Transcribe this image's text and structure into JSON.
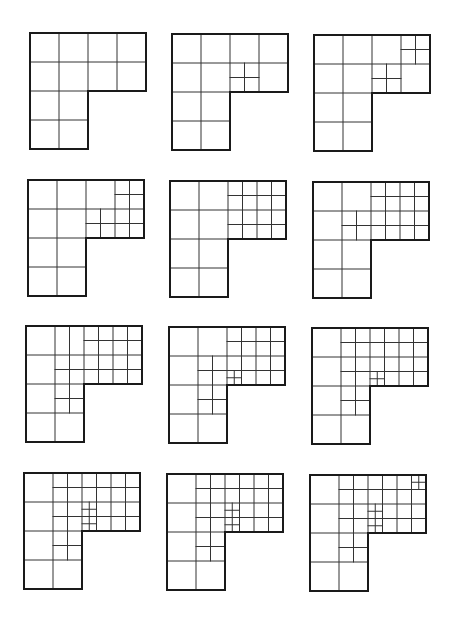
{
  "figure": {
    "unit_px": 29,
    "outline_color": "#1a1a1a",
    "line_color": "#333333",
    "panels": [
      {
        "id": 1,
        "x": 29,
        "y": 32,
        "segments": []
      },
      {
        "id": 2,
        "x": 171,
        "y": 33,
        "segments": [
          [
            2.5,
            1,
            2.5,
            2
          ],
          [
            2,
            1.5,
            3,
            1.5
          ]
        ]
      },
      {
        "id": 3,
        "x": 313,
        "y": 34,
        "segments": [
          [
            2.5,
            1,
            2.5,
            2
          ],
          [
            2,
            1.5,
            3,
            1.5
          ],
          [
            3.5,
            0,
            3.5,
            1
          ],
          [
            3,
            0.5,
            4,
            0.5
          ]
        ]
      },
      {
        "id": 4,
        "x": 27,
        "y": 179,
        "segments": [
          [
            3.5,
            0,
            3.5,
            2
          ],
          [
            3,
            0.5,
            4,
            0.5
          ],
          [
            2.5,
            1,
            2.5,
            2
          ],
          [
            2,
            1.5,
            4,
            1.5
          ]
        ]
      },
      {
        "id": 5,
        "x": 169,
        "y": 180,
        "segments": [
          [
            2.5,
            0,
            2.5,
            2
          ],
          [
            3.5,
            0,
            3.5,
            2
          ],
          [
            2,
            0.5,
            4,
            0.5
          ],
          [
            2,
            1.5,
            4,
            1.5
          ]
        ]
      },
      {
        "id": 6,
        "x": 312,
        "y": 181,
        "segments": [
          [
            2.5,
            0,
            2.5,
            2
          ],
          [
            3.5,
            0,
            3.5,
            2
          ],
          [
            2,
            0.5,
            4,
            0.5
          ],
          [
            2,
            1.5,
            4,
            1.5
          ],
          [
            1.5,
            1,
            1.5,
            2
          ],
          [
            1,
            1.5,
            2,
            1.5
          ]
        ]
      },
      {
        "id": 7,
        "x": 25,
        "y": 325,
        "segments": [
          [
            2.5,
            0,
            2.5,
            2
          ],
          [
            3.5,
            0,
            3.5,
            2
          ],
          [
            2,
            0.5,
            4,
            0.5
          ],
          [
            1,
            1.5,
            4,
            1.5
          ],
          [
            1.5,
            0,
            1.5,
            3
          ],
          [
            1,
            2.5,
            2,
            2.5
          ]
        ]
      },
      {
        "id": 8,
        "x": 168,
        "y": 326,
        "segments": [
          [
            2.5,
            0,
            2.5,
            2
          ],
          [
            3.5,
            0,
            3.5,
            2
          ],
          [
            2,
            0.5,
            4,
            0.5
          ],
          [
            1,
            1.5,
            4,
            1.5
          ],
          [
            1.5,
            1,
            1.5,
            3
          ],
          [
            1,
            2.5,
            2,
            2.5
          ],
          [
            2.25,
            1.5,
            2.25,
            2
          ],
          [
            2,
            1.75,
            2.5,
            1.75
          ]
        ]
      },
      {
        "id": 9,
        "x": 311,
        "y": 327,
        "segments": [
          [
            2.5,
            0,
            2.5,
            2
          ],
          [
            3.5,
            0,
            3.5,
            2
          ],
          [
            1,
            0.5,
            4,
            0.5
          ],
          [
            1,
            1.5,
            4,
            1.5
          ],
          [
            1.5,
            0,
            1.5,
            3
          ],
          [
            1,
            2.5,
            2,
            2.5
          ],
          [
            2.25,
            1.5,
            2.25,
            2
          ],
          [
            2,
            1.75,
            2.5,
            1.75
          ]
        ]
      },
      {
        "id": 10,
        "x": 23,
        "y": 472,
        "segments": [
          [
            2.5,
            0,
            2.5,
            2
          ],
          [
            3.5,
            0,
            3.5,
            2
          ],
          [
            1,
            0.5,
            4,
            0.5
          ],
          [
            1,
            1.5,
            4,
            1.5
          ],
          [
            1.5,
            0,
            1.5,
            3
          ],
          [
            1,
            2.5,
            2,
            2.5
          ],
          [
            2.25,
            1,
            2.25,
            2
          ],
          [
            2,
            1.25,
            2.5,
            1.25
          ],
          [
            2,
            1.75,
            2.5,
            1.75
          ]
        ]
      },
      {
        "id": 11,
        "x": 166,
        "y": 473,
        "segments": [
          [
            2.5,
            0,
            2.5,
            2
          ],
          [
            3.5,
            0,
            3.5,
            2
          ],
          [
            1,
            0.5,
            4,
            0.5
          ],
          [
            1,
            1.5,
            4,
            1.5
          ],
          [
            1.5,
            0,
            1.5,
            3
          ],
          [
            1,
            2.5,
            2,
            2.5
          ],
          [
            2.25,
            1,
            2.25,
            2
          ],
          [
            2,
            1.25,
            2.5,
            1.25
          ],
          [
            2,
            1.75,
            2.5,
            1.75
          ]
        ]
      },
      {
        "id": 12,
        "x": 309,
        "y": 474,
        "segments": [
          [
            2.5,
            0,
            2.5,
            2
          ],
          [
            3.5,
            0,
            3.5,
            2
          ],
          [
            1,
            0.5,
            4,
            0.5
          ],
          [
            1,
            1.5,
            4,
            1.5
          ],
          [
            1.5,
            0,
            1.5,
            3
          ],
          [
            1,
            2.5,
            2,
            2.5
          ],
          [
            2.25,
            1,
            2.25,
            2
          ],
          [
            2,
            1.25,
            2.5,
            1.25
          ],
          [
            2,
            1.75,
            2.5,
            1.75
          ],
          [
            3.75,
            0,
            3.75,
            0.5
          ],
          [
            3.5,
            0.25,
            4,
            0.25
          ]
        ]
      }
    ]
  }
}
